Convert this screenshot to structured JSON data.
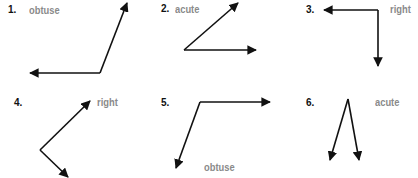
{
  "colors": {
    "stroke": "#111111",
    "label": "#8a8a8a",
    "number": "#111111"
  },
  "problems": [
    {
      "number": "1.",
      "answer": "obtuse",
      "vertex": [
        100,
        73
      ],
      "rays": [
        [
          30,
          73
        ],
        [
          127,
          3
        ]
      ],
      "num_pos": [
        8,
        4
      ],
      "label_pos": [
        29,
        4
      ]
    },
    {
      "number": "2.",
      "answer": "acute",
      "vertex": [
        184,
        50
      ],
      "rays": [
        [
          238,
          3
        ],
        [
          256,
          50
        ]
      ],
      "num_pos": [
        161,
        3
      ],
      "label_pos": [
        175,
        3
      ]
    },
    {
      "number": "3.",
      "answer": "right",
      "vertex": [
        378,
        10
      ],
      "rays": [
        [
          324,
          10
        ],
        [
          378,
          66
        ]
      ],
      "num_pos": [
        306,
        4
      ],
      "label_pos": [
        390,
        3
      ]
    },
    {
      "number": "4.",
      "answer": "right",
      "vertex": [
        40,
        150
      ],
      "rays": [
        [
          90,
          101
        ],
        [
          68,
          177
        ]
      ],
      "num_pos": [
        14,
        97
      ],
      "label_pos": [
        97,
        96
      ]
    },
    {
      "number": "5.",
      "answer": "obtuse",
      "vertex": [
        200,
        102
      ],
      "rays": [
        [
          270,
          102
        ],
        [
          176,
          168
        ]
      ],
      "num_pos": [
        161,
        97
      ],
      "label_pos": [
        204,
        161
      ]
    },
    {
      "number": "6.",
      "answer": "acute",
      "vertex": [
        348,
        99
      ],
      "rays": [
        [
          330,
          160
        ],
        [
          359,
          160
        ]
      ],
      "num_pos": [
        306,
        97
      ],
      "label_pos": [
        375,
        96
      ]
    }
  ]
}
